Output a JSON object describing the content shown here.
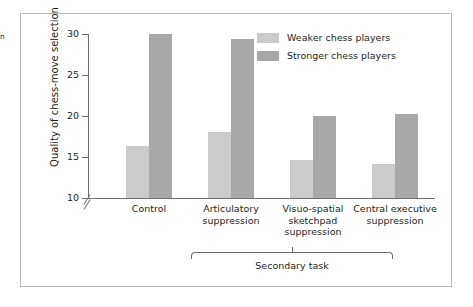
{
  "caption_fragment": "n",
  "chart_data": {
    "type": "bar",
    "title": "",
    "xlabel": "",
    "ylabel": "Quality of chess-move selection",
    "ylim": [
      10,
      30
    ],
    "yticks": [
      10,
      15,
      20,
      25,
      30
    ],
    "ytick_labels": [
      "10",
      "15",
      "20",
      "25",
      "30"
    ],
    "axis_break": true,
    "grid": false,
    "legend_position": "top-right",
    "categories": [
      "Control",
      "Articulatory suppression",
      "Visuo-spatial sketchpad suppression",
      "Central executive suppression"
    ],
    "group_bracket": {
      "label": "Secondary task",
      "spans_categories": [
        "Articulatory suppression",
        "Visuo-spatial sketchpad suppression",
        "Central executive suppression"
      ]
    },
    "series": [
      {
        "name": "Weaker chess players",
        "color": "#cbcbcb",
        "values": [
          16.4,
          18.0,
          14.6,
          14.2
        ]
      },
      {
        "name": "Stronger chess players",
        "color": "#a8a8a8",
        "values": [
          30.0,
          29.4,
          20.0,
          20.3
        ]
      }
    ]
  }
}
